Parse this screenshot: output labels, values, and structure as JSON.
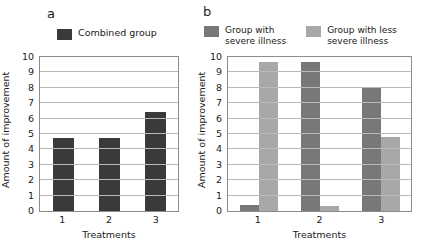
{
  "figure": {
    "background": "#ffffff",
    "panels": [
      {
        "letter": "a",
        "ylabel": "Amount of improvement",
        "xlabel": "Treatments"
      },
      {
        "letter": "b",
        "ylabel": "Amount of improvement",
        "xlabel": "Treatments"
      }
    ]
  },
  "colors": {
    "combined_group": "#3a3a3a",
    "severe_illness": "#787878",
    "less_severe_illness": "#a8a8a8",
    "gridline": "#b9b9b9",
    "axis": "#8c8c8c",
    "text": "#1a1a1a"
  },
  "chart_data": [
    {
      "type": "bar",
      "panel": "a",
      "title": "",
      "categories": [
        "1",
        "2",
        "3"
      ],
      "xlabel": "Treatments",
      "ylabel": "Amount of improvement",
      "ylim": [
        0,
        10
      ],
      "yticks": [
        0,
        1,
        2,
        3,
        4,
        5,
        6,
        7,
        8,
        9,
        10
      ],
      "grid": true,
      "legend_position": "above-plot-left",
      "series": [
        {
          "name": "Combined group",
          "color": "#3a3a3a",
          "values": [
            4.75,
            4.75,
            6.4
          ]
        }
      ]
    },
    {
      "type": "bar",
      "panel": "b",
      "title": "",
      "categories": [
        "1",
        "2",
        "3"
      ],
      "xlabel": "Treatments",
      "ylabel": "Amount of improvement",
      "ylim": [
        0,
        10
      ],
      "yticks": [
        0,
        1,
        2,
        3,
        4,
        5,
        6,
        7,
        8,
        9,
        10
      ],
      "grid": true,
      "legend_position": "above-plot",
      "series": [
        {
          "name": "Group with\nsevere illness",
          "color": "#787878",
          "values": [
            0.4,
            9.7,
            8.0
          ]
        },
        {
          "name": "Group with less\nsevere illness",
          "color": "#a8a8a8",
          "values": [
            9.7,
            0.35,
            4.8
          ]
        }
      ]
    }
  ]
}
